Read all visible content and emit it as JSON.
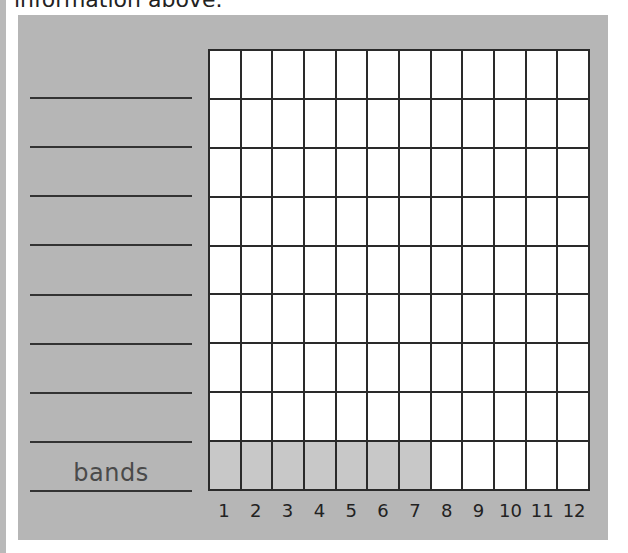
{
  "header": {
    "text": "information above."
  },
  "colors": {
    "panel": "#b6b6b6",
    "grid_line": "#2a2a2a",
    "cell_empty": "#ffffff",
    "cell_filled": "#c8c8c8"
  },
  "chart_data": {
    "type": "bar",
    "title": "",
    "xlabel": "",
    "ylabel": "",
    "categories": [
      "1",
      "2",
      "3",
      "4",
      "5",
      "6",
      "7",
      "8",
      "9",
      "10",
      "11",
      "12"
    ],
    "row_labels": [
      "",
      "",
      "",
      "",
      "",
      "",
      "",
      "",
      "bands"
    ],
    "series": [
      {
        "name": "bands",
        "values": [
          1,
          1,
          1,
          1,
          1,
          1,
          1,
          0,
          0,
          0,
          0,
          0
        ]
      }
    ],
    "grid": true,
    "rows": 9,
    "columns": 12,
    "ylim": [
      0,
      9
    ],
    "legend": "none"
  }
}
